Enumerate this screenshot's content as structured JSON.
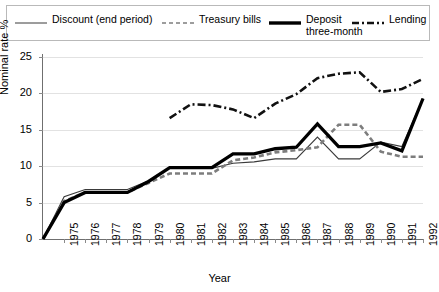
{
  "legend": {
    "items": [
      {
        "key": "discount",
        "label": "Discount (end period)",
        "style": "thin-solid",
        "color": "#3a3a3a"
      },
      {
        "key": "treasury",
        "label": "Treasury bills",
        "style": "dashed",
        "color": "#7d7d7d"
      },
      {
        "key": "deposit",
        "label": "Deposit\nthree-month",
        "style": "thick-solid",
        "color": "#000000"
      },
      {
        "key": "lending",
        "label": "Lending",
        "style": "dash-dot",
        "color": "#111111"
      }
    ]
  },
  "axes": {
    "ylabel": "Nominal rate %",
    "xlabel": "Year",
    "yticks": [
      "0",
      "5",
      "10",
      "15",
      "20",
      "25"
    ],
    "xticks": [
      "1975",
      "1976",
      "1977",
      "1978",
      "1979",
      "1980",
      "1981",
      "1982",
      "1983",
      "1984",
      "1985",
      "1986",
      "1987",
      "1988",
      "1989",
      "1990",
      "1991",
      "1992"
    ]
  },
  "chart_data": {
    "type": "line",
    "title": "",
    "xlabel": "Year",
    "ylabel": "Nominal rate %",
    "ylim": [
      0,
      25
    ],
    "xlim": [
      1974,
      1992
    ],
    "grid": true,
    "legend_position": "top",
    "x": [
      1974,
      1975,
      1976,
      1977,
      1978,
      1979,
      1980,
      1981,
      1982,
      1983,
      1984,
      1985,
      1986,
      1987,
      1988,
      1989,
      1990,
      1991,
      1992
    ],
    "series": [
      {
        "name": "Discount (end period)",
        "color": "#3a3a3a",
        "style": "thin-solid",
        "values": [
          0.0,
          5.8,
          6.8,
          6.8,
          6.8,
          8.0,
          9.7,
          9.7,
          9.7,
          10.4,
          10.6,
          11.0,
          11.0,
          14.0,
          11.0,
          11.0,
          13.3,
          12.7,
          19.3
        ]
      },
      {
        "name": "Treasury bills",
        "color": "#7d7d7d",
        "style": "dashed",
        "values": [
          0.0,
          5.2,
          6.4,
          6.4,
          6.4,
          7.7,
          9.0,
          9.0,
          9.0,
          10.8,
          11.2,
          11.9,
          12.2,
          12.6,
          15.7,
          15.7,
          12.0,
          11.3,
          11.3
        ]
      },
      {
        "name": "Deposit three-month",
        "color": "#000000",
        "style": "thick-solid",
        "values": [
          0.0,
          5.0,
          6.4,
          6.4,
          6.4,
          7.9,
          9.8,
          9.8,
          9.8,
          11.7,
          11.7,
          12.4,
          12.6,
          15.8,
          12.7,
          12.7,
          13.2,
          12.1,
          19.3
        ]
      },
      {
        "name": "Lending",
        "color": "#111111",
        "style": "dash-dot",
        "values": [
          null,
          null,
          null,
          null,
          null,
          null,
          16.6,
          18.5,
          18.4,
          17.8,
          16.6,
          18.6,
          19.9,
          22.1,
          22.7,
          22.9,
          20.2,
          20.6,
          22.0
        ]
      }
    ]
  }
}
